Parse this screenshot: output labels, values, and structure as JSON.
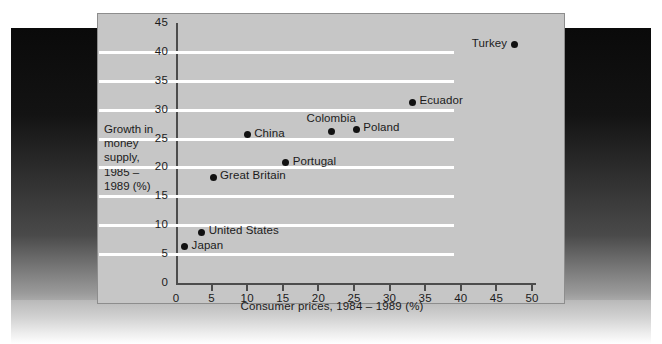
{
  "chart_data": {
    "type": "scatter",
    "title": "",
    "xlabel": "Consumer prices, 1984 – 1989 (%)",
    "ylabel": "Growth in money supply, 1985 – 1989 (%)",
    "ylabel_lines": [
      "Growth in",
      "money",
      "supply,",
      "1985 –",
      "1989 (%)"
    ],
    "xlim": [
      0,
      50
    ],
    "ylim": [
      0,
      45
    ],
    "xticks": [
      0,
      5,
      10,
      15,
      20,
      25,
      30,
      35,
      40,
      45,
      50
    ],
    "yticks": [
      0,
      5,
      10,
      15,
      20,
      25,
      30,
      35,
      40,
      45
    ],
    "grid": "horizontal",
    "gridline_color": "#ffffff",
    "plot_background": "#c6c6c6",
    "marker_color": "#111111",
    "legend": "none",
    "points": [
      {
        "label": "Japan",
        "x": 1.2,
        "y": 6.3,
        "label_side": "right"
      },
      {
        "label": "United States",
        "x": 3.6,
        "y": 8.8,
        "label_side": "right"
      },
      {
        "label": "Great Britain",
        "x": 5.2,
        "y": 18.3,
        "label_side": "right"
      },
      {
        "label": "China",
        "x": 10.0,
        "y": 25.7,
        "label_side": "right"
      },
      {
        "label": "Portugal",
        "x": 15.4,
        "y": 20.8,
        "label_side": "right"
      },
      {
        "label": "Colombia",
        "x": 21.8,
        "y": 26.2,
        "label_side": "above"
      },
      {
        "label": "Poland",
        "x": 25.3,
        "y": 26.6,
        "label_side": "right"
      },
      {
        "label": "Ecuador",
        "x": 33.2,
        "y": 31.3,
        "label_side": "right"
      },
      {
        "label": "Turkey",
        "x": 47.5,
        "y": 41.2,
        "label_side": "left"
      }
    ]
  }
}
